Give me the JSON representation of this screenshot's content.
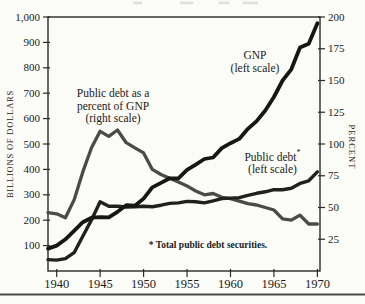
{
  "colors": {
    "axis": "#2a2a27",
    "gnp": "#161614",
    "public_debt": "#20201d",
    "percent_of_gnp": "#4a4a46",
    "bottom_rule": "#4c4c48"
  },
  "annotations": {
    "gnp": {
      "line1": "GNP",
      "line2": "(left scale)"
    },
    "pct": {
      "line1": "Public debt as a",
      "line2": "percent of GNP",
      "line3": "(right scale)"
    },
    "debt": {
      "line1": "Public debt",
      "marker": "*",
      "line2": "(left scale)"
    },
    "footnote": "* Total public debt securities."
  },
  "chart_data": {
    "type": "line",
    "x_axis_years": true,
    "x": [
      1939,
      1940,
      1941,
      1942,
      1943,
      1944,
      1945,
      1946,
      1947,
      1948,
      1949,
      1950,
      1951,
      1952,
      1953,
      1954,
      1955,
      1956,
      1957,
      1958,
      1959,
      1960,
      1961,
      1962,
      1963,
      1964,
      1965,
      1966,
      1967,
      1968,
      1969,
      1970
    ],
    "x_ticks": [
      "1940",
      "1945",
      "1950",
      "1955",
      "1960",
      "1965",
      "1970"
    ],
    "x_range": [
      1939,
      1970.3
    ],
    "grid": false,
    "y_left": {
      "label": "BILLIONS OF DOLLARS",
      "range": [
        0,
        1000
      ],
      "tick_labels": [
        "100",
        "200",
        "300",
        "400",
        "500",
        "600",
        "700",
        "800",
        "900",
        "1,000"
      ]
    },
    "y_right": {
      "label": "PERCENT",
      "range": [
        0,
        200
      ],
      "tick_labels": [
        "25",
        "50",
        "75",
        "100",
        "125",
        "150",
        "175",
        "200"
      ]
    },
    "series": [
      {
        "name": "Public debt as a percent of GNP (right scale)",
        "slug": "percent_of_gnp",
        "scale": "right",
        "values": [
          46,
          45,
          42,
          56,
          78,
          97,
          110,
          106,
          111,
          101,
          97,
          93,
          80,
          76,
          73,
          70,
          67,
          63,
          60,
          61,
          58,
          57,
          55,
          53,
          52,
          50,
          48,
          41,
          40,
          44,
          37,
          37
        ]
      },
      {
        "name": "Public debt (left scale)",
        "slug": "public_debt",
        "scale": "left",
        "values": [
          45,
          43,
          49,
          72,
          137,
          201,
          273,
          255,
          255,
          252,
          253,
          255,
          253,
          259,
          266,
          268,
          274,
          273,
          268,
          276,
          285,
          287,
          289,
          298,
          306,
          312,
          320,
          320,
          326,
          345,
          355,
          390
        ]
      },
      {
        "name": "GNP (left scale)",
        "slug": "gnp",
        "scale": "left",
        "values": [
          88,
          100,
          125,
          158,
          192,
          210,
          212,
          211,
          233,
          259,
          257,
          285,
          329,
          347,
          365,
          365,
          398,
          419,
          441,
          447,
          484,
          503,
          520,
          560,
          590,
          632,
          685,
          750,
          794,
          880,
          895,
          975
        ]
      }
    ]
  }
}
